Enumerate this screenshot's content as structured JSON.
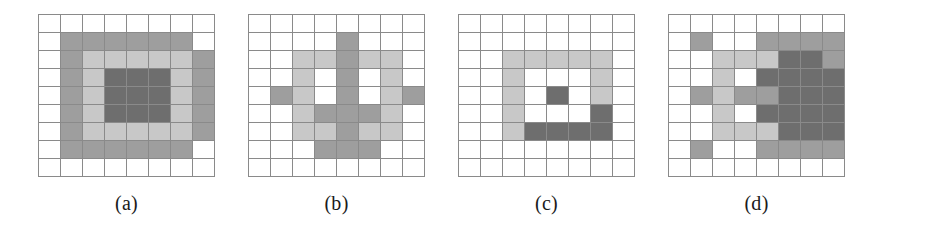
{
  "figure": {
    "title": "",
    "grid": {
      "columns": 8,
      "rows": 9,
      "cell_width_px": 22,
      "cell_height_px": 18
    },
    "palette": {
      "empty": "#ffffff",
      "light_gray": "#c8c8c8",
      "medium_gray": "#9e9e9e",
      "dark_gray": "#6e6e6e",
      "grid_line": "#8a8a8a"
    },
    "legend_levels": [
      0,
      1,
      2,
      3
    ],
    "panels": [
      {
        "id": "panel-a",
        "caption": "(a)",
        "description": "concentric nested rectangles",
        "cells": [
          [
            0,
            0,
            0,
            0,
            0,
            0,
            0,
            0
          ],
          [
            0,
            2,
            2,
            2,
            2,
            2,
            2,
            0
          ],
          [
            0,
            2,
            1,
            1,
            1,
            1,
            1,
            2
          ],
          [
            0,
            2,
            1,
            3,
            3,
            3,
            1,
            2
          ],
          [
            0,
            2,
            1,
            3,
            3,
            3,
            1,
            2
          ],
          [
            0,
            2,
            1,
            3,
            3,
            3,
            1,
            2
          ],
          [
            0,
            2,
            1,
            1,
            1,
            1,
            1,
            2
          ],
          [
            0,
            2,
            2,
            2,
            2,
            2,
            2,
            0
          ],
          [
            0,
            0,
            0,
            0,
            0,
            0,
            0,
            0
          ]
        ]
      },
      {
        "id": "panel-b",
        "caption": "(b)",
        "description": "star / cross shaped cluster",
        "cells": [
          [
            0,
            0,
            0,
            0,
            0,
            0,
            0,
            0
          ],
          [
            0,
            0,
            0,
            0,
            2,
            0,
            0,
            0
          ],
          [
            0,
            0,
            1,
            1,
            2,
            1,
            1,
            0
          ],
          [
            0,
            0,
            1,
            0,
            2,
            0,
            1,
            0
          ],
          [
            0,
            2,
            1,
            0,
            2,
            0,
            1,
            2
          ],
          [
            0,
            0,
            1,
            2,
            2,
            2,
            1,
            0
          ],
          [
            0,
            0,
            1,
            1,
            2,
            1,
            1,
            0
          ],
          [
            0,
            0,
            0,
            2,
            2,
            2,
            0,
            0
          ],
          [
            0,
            0,
            0,
            0,
            0,
            0,
            0,
            0
          ]
        ]
      },
      {
        "id": "panel-c",
        "caption": "(c)",
        "description": "open square ring with dark centre dot",
        "cells": [
          [
            0,
            0,
            0,
            0,
            0,
            0,
            0,
            0
          ],
          [
            0,
            0,
            0,
            0,
            0,
            0,
            0,
            0
          ],
          [
            0,
            0,
            1,
            1,
            1,
            1,
            1,
            0
          ],
          [
            0,
            0,
            1,
            0,
            0,
            0,
            1,
            0
          ],
          [
            0,
            0,
            1,
            0,
            3,
            0,
            1,
            0
          ],
          [
            0,
            0,
            1,
            0,
            0,
            0,
            3,
            0
          ],
          [
            0,
            0,
            1,
            3,
            3,
            3,
            3,
            0
          ],
          [
            0,
            0,
            0,
            0,
            0,
            0,
            0,
            0
          ],
          [
            0,
            0,
            0,
            0,
            0,
            0,
            0,
            0
          ]
        ]
      },
      {
        "id": "panel-d",
        "caption": "(d)",
        "description": "scattered cluster with dense dark block at right",
        "cells": [
          [
            0,
            0,
            0,
            0,
            0,
            0,
            0,
            0
          ],
          [
            0,
            2,
            0,
            0,
            2,
            2,
            2,
            2
          ],
          [
            0,
            0,
            1,
            1,
            1,
            3,
            3,
            2
          ],
          [
            0,
            0,
            1,
            0,
            3,
            3,
            3,
            3
          ],
          [
            0,
            2,
            1,
            2,
            2,
            3,
            3,
            3
          ],
          [
            0,
            0,
            1,
            0,
            3,
            3,
            3,
            3
          ],
          [
            0,
            0,
            1,
            1,
            1,
            3,
            3,
            3
          ],
          [
            0,
            2,
            0,
            0,
            2,
            2,
            2,
            2
          ],
          [
            0,
            0,
            0,
            0,
            0,
            0,
            0,
            0
          ]
        ]
      }
    ]
  }
}
